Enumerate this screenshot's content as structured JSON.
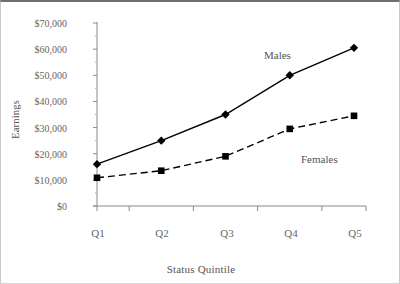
{
  "chart_data": {
    "type": "line",
    "title": "",
    "xlabel": "Status Quintile",
    "ylabel": "Earnings",
    "categories": [
      "Q1",
      "Q2",
      "Q3",
      "Q4",
      "Q5"
    ],
    "ylim": [
      0,
      70000
    ],
    "ytick_labels": [
      "$0",
      "$10,000",
      "$20,000",
      "$30,000",
      "$40,000",
      "$50,000",
      "$60,000",
      "$70,000"
    ],
    "ytick_values": [
      0,
      10000,
      20000,
      30000,
      40000,
      50000,
      60000,
      70000
    ],
    "ytick_interval": 10000,
    "minor_ticks": true,
    "grid": false,
    "legend_position": "inline-annotation",
    "series": [
      {
        "name": "Males",
        "values": [
          16000,
          25000,
          35000,
          50000,
          60500
        ],
        "marker": "diamond",
        "line_style": "solid",
        "color": "#000000",
        "label_x": 263,
        "label_y": 47
      },
      {
        "name": "Females",
        "values": [
          10800,
          13500,
          19000,
          29500,
          34500
        ],
        "marker": "square",
        "line_style": "dashed",
        "color": "#000000",
        "label_x": 300,
        "label_y": 151
      }
    ]
  },
  "axes": {
    "x_axis_color": "#8a8a8a",
    "y_axis_color": "#8a8a8a",
    "plot_left": 96,
    "plot_right": 353,
    "plot_top": 21,
    "plot_bottom": 204
  },
  "frame": {
    "border_top_color": "#6e6e6e",
    "background": "#ffffff"
  }
}
